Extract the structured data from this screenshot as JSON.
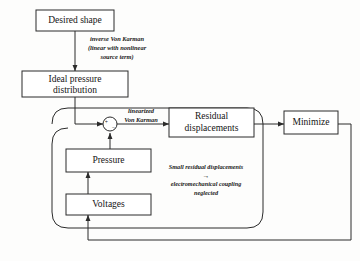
{
  "diagram": {
    "colors": {
      "stroke": "#2b2b2b",
      "text": "#141414",
      "background": "#fdfdfc"
    },
    "blocks": {
      "desired_shape": "Desired shape",
      "ideal_pressure_line1": "Ideal pressure",
      "ideal_pressure_line2": "distribution",
      "residual_line1": "Residual",
      "residual_line2": "displacements",
      "minimize": "Minimize",
      "pressure": "Pressure",
      "voltages": "Voltages"
    },
    "annotations": {
      "inverse_vk_line1": "inverse Von Karman",
      "inverse_vk_line2": "(linear with nonlinear",
      "inverse_vk_line3": "source term)",
      "linearized_line1": "linearized",
      "linearized_line2": "Von Karman",
      "coupling_line1": "Small residual displacements",
      "coupling_arrow": "→",
      "coupling_line2": "electromechanical coupling",
      "coupling_line3": "neglected"
    },
    "summing_junction": {
      "plus": "+",
      "minus": "−"
    }
  }
}
